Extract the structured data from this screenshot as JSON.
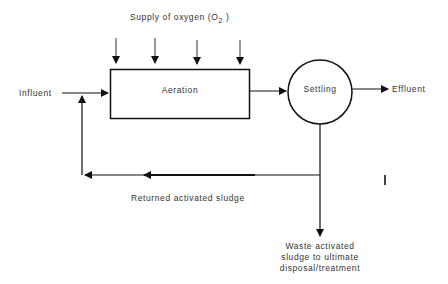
{
  "diagram": {
    "title_prefix": "Supply of oxygen (O",
    "title_subscript": "2",
    "title_suffix": " )",
    "nodes": {
      "aeration": "Aeration",
      "settling": "Settling"
    },
    "flows": {
      "influent": "Influent",
      "effluent": "Effluent",
      "returned": "Returned activated sludge",
      "waste_line1": "Waste activated",
      "waste_line2": "sludge to ultimate",
      "waste_line3": "disposal/treatment"
    },
    "colors": {
      "stroke": "#111111",
      "text": "#333333",
      "background": "#ffffff"
    }
  }
}
